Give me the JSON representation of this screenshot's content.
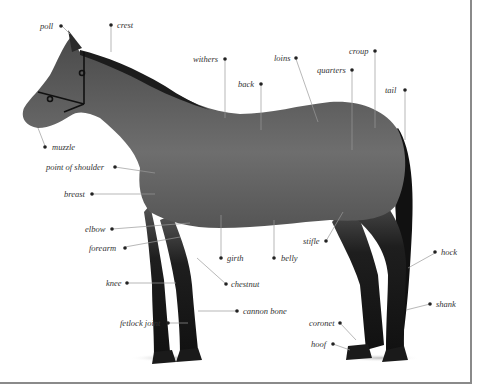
{
  "diagram": {
    "labels": [
      {
        "id": "poll",
        "text": "poll",
        "x": 40,
        "y": 22
      },
      {
        "id": "crest",
        "text": "crest",
        "x": 117,
        "y": 21
      },
      {
        "id": "withers",
        "text": "withers",
        "x": 193,
        "y": 55
      },
      {
        "id": "loins",
        "text": "loins",
        "x": 274,
        "y": 54
      },
      {
        "id": "croup",
        "text": "croup",
        "x": 349,
        "y": 47
      },
      {
        "id": "quarters",
        "text": "quarters",
        "x": 317,
        "y": 66
      },
      {
        "id": "back",
        "text": "back",
        "x": 238,
        "y": 79
      },
      {
        "id": "tail",
        "text": "tail",
        "x": 385,
        "y": 85
      },
      {
        "id": "muzzle",
        "text": "muzzle",
        "x": 52,
        "y": 142
      },
      {
        "id": "point-of-shoulder",
        "text": "point of shoulder",
        "x": 46,
        "y": 163
      },
      {
        "id": "breast",
        "text": "breast",
        "x": 64,
        "y": 189
      },
      {
        "id": "elbow",
        "text": "elbow",
        "x": 85,
        "y": 225
      },
      {
        "id": "forearm",
        "text": "forearm",
        "x": 89,
        "y": 243
      },
      {
        "id": "girth",
        "text": "girth",
        "x": 225,
        "y": 254
      },
      {
        "id": "belly",
        "text": "belly",
        "x": 281,
        "y": 254
      },
      {
        "id": "stifle",
        "text": "stifle",
        "x": 303,
        "y": 237
      },
      {
        "id": "hock",
        "text": "hock",
        "x": 441,
        "y": 248
      },
      {
        "id": "knee",
        "text": "knee",
        "x": 106,
        "y": 278
      },
      {
        "id": "chestnut",
        "text": "chestnut",
        "x": 231,
        "y": 280
      },
      {
        "id": "cannon-bone",
        "text": "cannon bone",
        "x": 243,
        "y": 307
      },
      {
        "id": "shank",
        "text": "shank",
        "x": 436,
        "y": 299
      },
      {
        "id": "fetlock-joint",
        "text": "fetlock joint",
        "x": 120,
        "y": 318
      },
      {
        "id": "coronet",
        "text": "coronet",
        "x": 309,
        "y": 318
      },
      {
        "id": "hoof",
        "text": "hoof",
        "x": 311,
        "y": 339
      }
    ]
  }
}
